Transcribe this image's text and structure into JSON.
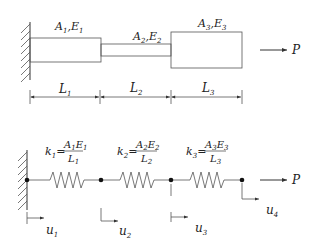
{
  "top_diagram": {
    "description": "Stepped bar fixed at left wall, loaded by axial force P",
    "segments": [
      {
        "area": "A",
        "area_sub": "1",
        "modulus": "E",
        "modulus_sub": "1",
        "length": "L",
        "length_sub": "1"
      },
      {
        "area": "A",
        "area_sub": "2",
        "modulus": "E",
        "modulus_sub": "2",
        "length": "L",
        "length_sub": "2"
      },
      {
        "area": "A",
        "area_sub": "3",
        "modulus": "E",
        "modulus_sub": "3",
        "length": "L",
        "length_sub": "3"
      }
    ],
    "load": "P"
  },
  "bottom_diagram": {
    "description": "Equivalent spring model",
    "springs": [
      {
        "k": "k",
        "k_sub": "1",
        "num_a": "A",
        "num_a_sub": "1",
        "num_e": "E",
        "num_e_sub": "1",
        "den": "L",
        "den_sub": "1"
      },
      {
        "k": "k",
        "k_sub": "2",
        "num_a": "A",
        "num_a_sub": "2",
        "num_e": "E",
        "num_e_sub": "2",
        "den": "L",
        "den_sub": "2"
      },
      {
        "k": "k",
        "k_sub": "3",
        "num_a": "A",
        "num_a_sub": "3",
        "num_e": "E",
        "num_e_sub": "3",
        "den": "L",
        "den_sub": "3"
      }
    ],
    "displacements": [
      {
        "u": "u",
        "sub": "1"
      },
      {
        "u": "u",
        "sub": "2"
      },
      {
        "u": "u",
        "sub": "3"
      },
      {
        "u": "u",
        "sub": "4"
      }
    ],
    "load": "P",
    "equals": "="
  }
}
